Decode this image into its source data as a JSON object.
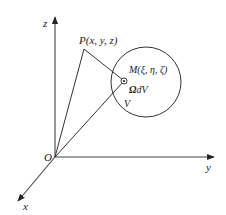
{
  "diagram": {
    "type": "3d-coordinate-geometry",
    "axes": {
      "z_label": "z",
      "y_label": "y",
      "x_label": "x",
      "origin_label": "O"
    },
    "points": {
      "P_label": "P(x, y, z)",
      "M_label": "M(ξ, η, ζ)"
    },
    "volume": {
      "element_label_bold": "Ω",
      "element_label_rest": "dV",
      "region_label": "V"
    },
    "colors": {
      "stroke": "#333333",
      "background": "#ffffff"
    }
  }
}
